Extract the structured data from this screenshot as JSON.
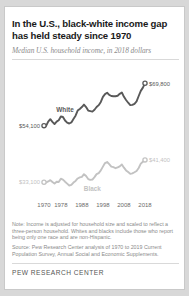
{
  "title": "In the U.S., black-white income gap has held steady since 1970",
  "subtitle": "Median U.S. household income, in 2018 dollars",
  "note": "Note: Income is adjusted for household size and scaled to reflect a three-person household. Whites and blacks include those who report being only one race and are non-Hispanic.",
  "source": "Source: Pew Research Center analysis of 1970 to 2019 Current Population Survey, Annual Social and Economic Supplements.",
  "brand": "PEW RESEARCH CENTER",
  "colors": {
    "white_series": "#595959",
    "black_series": "#c2c2c2",
    "text": "#1a1a1a",
    "muted": "#8a8a8a",
    "card": "#ffffff",
    "page": "#d8d8d8"
  },
  "labels": {
    "white_series": "White",
    "black_series": "Black",
    "white_start_value": "$54,100",
    "white_end_value": "$69,800",
    "black_start_value": "$33,100",
    "black_end_value": "$41,400"
  },
  "chart_data": {
    "type": "line",
    "title": "In the U.S., black-white income gap has held steady since 1970",
    "subtitle": "Median U.S. household income, in 2018 dollars",
    "xlabel": "",
    "ylabel": "Median household income (2018 dollars)",
    "xlim": [
      1970,
      2018
    ],
    "ylim": [
      28000,
      74000
    ],
    "grid": false,
    "legend": "inline-labels",
    "xticks": [
      "1970",
      "1978",
      "1988",
      "1998",
      "2008",
      "2018"
    ],
    "xtick_values": [
      1970,
      1978,
      1988,
      1998,
      2008,
      2018
    ],
    "endpoint_markers": true,
    "series": [
      {
        "name": "White",
        "color": "#595959",
        "start_label": "$54,100",
        "end_label": "$69,800",
        "x": [
          1970,
          1971,
          1972,
          1973,
          1974,
          1975,
          1976,
          1977,
          1978,
          1979,
          1980,
          1981,
          1982,
          1983,
          1984,
          1985,
          1986,
          1987,
          1988,
          1989,
          1990,
          1991,
          1992,
          1993,
          1994,
          1995,
          1996,
          1997,
          1998,
          1999,
          2000,
          2001,
          2002,
          2003,
          2004,
          2005,
          2006,
          2007,
          2008,
          2009,
          2010,
          2011,
          2012,
          2013,
          2014,
          2015,
          2016,
          2017,
          2018
        ],
        "values": [
          54100,
          54000,
          55600,
          56500,
          55500,
          54700,
          55600,
          56100,
          57500,
          57300,
          56000,
          55200,
          54900,
          55300,
          56600,
          57800,
          59700,
          60300,
          61000,
          61900,
          61000,
          59700,
          59500,
          59300,
          60000,
          61000,
          61700,
          62900,
          64800,
          65800,
          66300,
          65500,
          65100,
          65000,
          65000,
          65200,
          65900,
          66400,
          64800,
          63600,
          62600,
          61700,
          61800,
          62200,
          63100,
          65100,
          67000,
          68200,
          69800
        ]
      },
      {
        "name": "Black",
        "color": "#c2c2c2",
        "start_label": "$33,100",
        "end_label": "$41,400",
        "x": [
          1970,
          1971,
          1972,
          1973,
          1974,
          1975,
          1976,
          1977,
          1978,
          1979,
          1980,
          1981,
          1982,
          1983,
          1984,
          1985,
          1986,
          1987,
          1988,
          1989,
          1990,
          1991,
          1992,
          1993,
          1994,
          1995,
          1996,
          1997,
          1998,
          1999,
          2000,
          2001,
          2002,
          2003,
          2004,
          2005,
          2006,
          2007,
          2008,
          2009,
          2010,
          2011,
          2012,
          2013,
          2014,
          2015,
          2016,
          2017,
          2018
        ],
        "values": [
          33100,
          33000,
          33400,
          33900,
          33200,
          32600,
          33300,
          33200,
          34400,
          34100,
          33300,
          32600,
          31900,
          32100,
          33000,
          33600,
          34500,
          34900,
          35100,
          36100,
          35400,
          34300,
          34000,
          34100,
          35000,
          36100,
          36500,
          37500,
          38900,
          40200,
          40600,
          39800,
          38900,
          38700,
          38300,
          38600,
          39000,
          39700,
          38500,
          37500,
          36900,
          36200,
          36400,
          36800,
          37300,
          38400,
          40000,
          40700,
          41400
        ]
      }
    ]
  }
}
